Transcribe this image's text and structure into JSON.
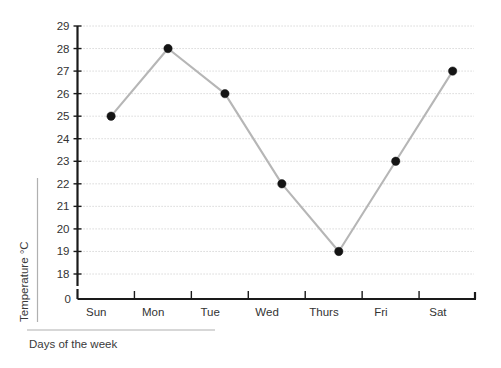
{
  "chart_data": {
    "type": "line",
    "title": "",
    "subtitle": "",
    "xlabel": "Days of the week",
    "ylabel": "Temperature   °C",
    "categories": [
      "Sun",
      "Mon",
      "Tue",
      "Wed",
      "Thurs",
      "Fri",
      "Sat"
    ],
    "values": [
      25,
      28,
      26,
      22,
      19,
      23,
      27
    ],
    "series": [
      {
        "name": "Temperature",
        "values": [
          25,
          28,
          26,
          22,
          19,
          23,
          27
        ]
      }
    ],
    "ylim": [
      18,
      29
    ],
    "y_ticks": [
      18,
      19,
      20,
      21,
      22,
      23,
      24,
      25,
      26,
      27,
      28,
      29
    ],
    "y_tick_labels": [
      "18",
      "19",
      "20",
      "21",
      "22",
      "23",
      "24",
      "25",
      "26",
      "27",
      "28",
      "29"
    ],
    "y_axis_break_label": "0",
    "x_tick_labels": [
      "Sun",
      "Mon",
      "Tue",
      "Wed",
      "Thurs",
      "Fri",
      "Sat"
    ],
    "grid": "horizontal-dotted",
    "legend": "none",
    "marker_style": "filled-circle",
    "line_color": "#b6b6b6",
    "marker_color": "#141414",
    "axis_color": "#1a1a1a",
    "grid_color": "#c9c9c9",
    "background_color": "#ffffff"
  }
}
